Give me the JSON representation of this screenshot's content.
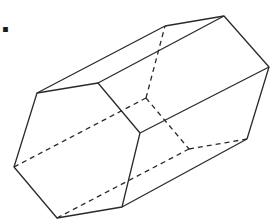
{
  "label": "d.",
  "figure": {
    "type": "hexagonal-prism",
    "stroke_color": "#2a2a2a",
    "front_face": {
      "A": [
        37,
        93
      ],
      "B": [
        98,
        83
      ],
      "C": [
        140,
        133
      ],
      "D": [
        122,
        207
      ],
      "E": [
        57,
        218
      ],
      "F": [
        14,
        167
      ]
    },
    "back_face": {
      "A": [
        165,
        26
      ],
      "B": [
        224,
        16
      ],
      "C": [
        269,
        67
      ],
      "D": [
        247,
        139
      ],
      "E": [
        189,
        149
      ],
      "F": [
        146,
        98
      ]
    },
    "hidden_edges": [
      "back F-A",
      "back F-E",
      "back E-D",
      "lateral F-F'",
      "lateral E-E'"
    ]
  }
}
